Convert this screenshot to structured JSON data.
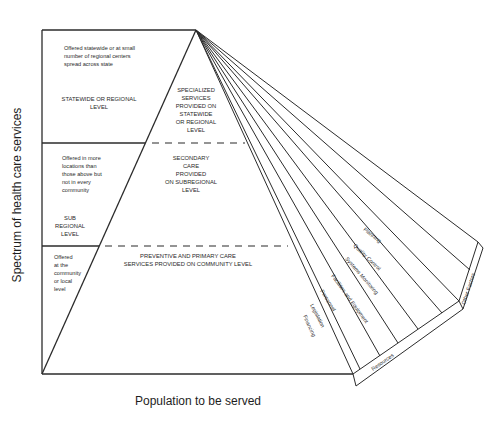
{
  "diagram": {
    "type": "pyramid-with-fan",
    "axes": {
      "y_label": "Spectrum of health care services",
      "x_label": "Population to be served"
    },
    "levels": [
      {
        "name": "statewide",
        "left_note": [
          "Offered statewide or at small",
          "number of regional centers",
          "spread across state"
        ],
        "left_title": [
          "STATEWIDE OR REGIONAL",
          "LEVEL"
        ],
        "pyramid_text": [
          "SPECIALIZED",
          "SERVICES",
          "PROVIDED ON",
          "STATEWIDE",
          "OR REGIONAL",
          "LEVEL"
        ]
      },
      {
        "name": "subregional",
        "left_note": [
          "Offered in more",
          "locations than",
          "those above but",
          "not in every",
          "community"
        ],
        "left_title": [
          "SUB",
          "REGIONAL",
          "LEVEL"
        ],
        "pyramid_text": [
          "SECONDARY",
          "CARE",
          "PROVIDED",
          "ON SUBREGIONAL",
          "LEVEL"
        ]
      },
      {
        "name": "community",
        "left_note": [
          "Offered",
          "at the",
          "community",
          "or local",
          "level"
        ],
        "left_title": [],
        "pyramid_text": [
          "PREVENTIVE AND PRIMARY CARE",
          "SERVICES PROVIDED ON COMMUNITY LEVEL"
        ]
      }
    ],
    "fan_factors": {
      "resources_group_label": "Resources",
      "resources": [
        "Financing",
        "Legislation",
        "Personnel",
        "Facilities and Equipment"
      ],
      "other_group_label": "Other Factors",
      "other": [
        "Systems Monitoring",
        "Quality Control",
        "Planning"
      ]
    }
  }
}
